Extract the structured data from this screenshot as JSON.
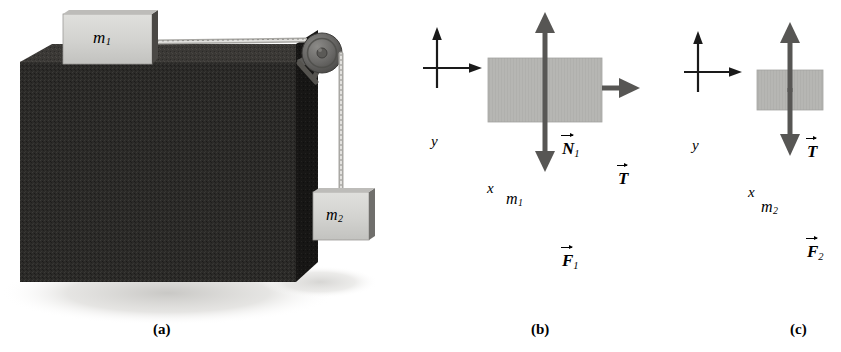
{
  "figure": {
    "background_color": "#ffffff",
    "width": 841,
    "height": 352
  },
  "colors": {
    "table_dark": "#2b2a28",
    "table_top_face": "#3a3836",
    "table_side_face": "#171615",
    "block_face": "#d2d2cf",
    "block_face_b": "#b3b3b0",
    "block_edge_dark": "#4a4845",
    "pulley_body": "#6e6d6b",
    "pulley_dark": "#4d4c4a",
    "rope": "#b9b8b4",
    "shadow": "#cfcecb",
    "arrow": "#575654",
    "axis": "#1a1a1a",
    "text": "#000000"
  },
  "panel_a": {
    "caption": "(a)",
    "block_top_label": "m",
    "block_top_sub": "1",
    "block_hanging_label": "m",
    "block_hanging_sub": "2",
    "parts": {
      "table": "table-block",
      "pulley": "pulley",
      "rope_horizontal": "rope-horizontal",
      "rope_vertical": "rope-vertical",
      "shadow": "ground-shadow"
    }
  },
  "panel_b": {
    "caption": "(b)",
    "axis_x_label": "x",
    "axis_y_label": "y",
    "body_label": "m",
    "body_sub": "1",
    "forces": [
      {
        "name": "normal-force",
        "symbol": "N",
        "sub": "1",
        "direction": "up"
      },
      {
        "name": "tension-force",
        "symbol": "T",
        "sub": "",
        "direction": "right"
      },
      {
        "name": "weight-force",
        "symbol": "F",
        "sub": "1",
        "direction": "down"
      }
    ]
  },
  "panel_c": {
    "caption": "(c)",
    "axis_x_label": "x",
    "axis_y_label": "y",
    "body_label": "m",
    "body_sub": "2",
    "forces": [
      {
        "name": "tension-force",
        "symbol": "T",
        "sub": "",
        "direction": "up"
      },
      {
        "name": "weight-force",
        "symbol": "F",
        "sub": "2",
        "direction": "down"
      }
    ]
  }
}
